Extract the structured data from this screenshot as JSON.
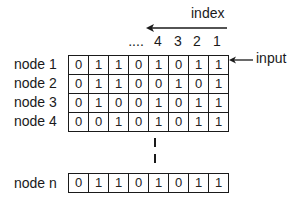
{
  "diagram": {
    "index": {
      "label": "index",
      "ellipsis": "....",
      "numbers": [
        "4",
        "3",
        "2",
        "1"
      ],
      "arrow_direction": "left"
    },
    "input": {
      "label": "input",
      "arrow_direction": "left",
      "points_to_row": "node 1"
    },
    "rows": [
      {
        "label": "node 1",
        "bits": [
          "0",
          "1",
          "1",
          "0",
          "1",
          "0",
          "1",
          "1"
        ]
      },
      {
        "label": "node 2",
        "bits": [
          "0",
          "1",
          "1",
          "0",
          "0",
          "1",
          "0",
          "1"
        ]
      },
      {
        "label": "node 3",
        "bits": [
          "0",
          "1",
          "0",
          "0",
          "1",
          "0",
          "1",
          "1"
        ]
      },
      {
        "label": "node 4",
        "bits": [
          "0",
          "0",
          "1",
          "0",
          "1",
          "0",
          "1",
          "1"
        ]
      }
    ],
    "continuation": "vertical dashed line",
    "last_row": {
      "label": "node n",
      "bits": [
        "0",
        "1",
        "1",
        "0",
        "1",
        "0",
        "1",
        "1"
      ]
    }
  }
}
